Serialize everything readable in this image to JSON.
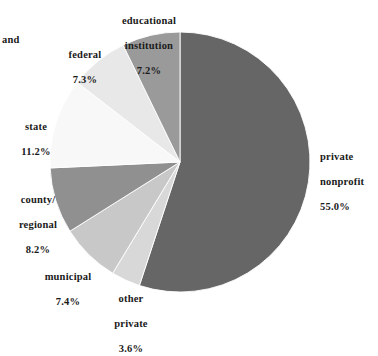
{
  "chart_data": {
    "type": "pie",
    "title": "",
    "subtitle": "",
    "xlabel": "",
    "ylabel": "",
    "legend_position": "none",
    "labels_position": "outside-callouts",
    "grid": false,
    "units": "percent",
    "total": 99.9,
    "start_angle_deg": 0,
    "direction": "clockwise",
    "categories": [
      "private nonprofit",
      "other private",
      "municipal",
      "county/ regional",
      "state",
      "federal",
      "educational institution"
    ],
    "values": [
      55.0,
      3.6,
      7.4,
      8.2,
      11.2,
      7.3,
      7.2
    ],
    "colors": [
      "#666666",
      "#d8d8d8",
      "#c8c8c8",
      "#909090",
      "#f8f8f8",
      "#e8e8e8",
      "#9a9a9a"
    ],
    "slices": [
      {
        "name": "private nonprofit",
        "label_line1": "private",
        "label_line2": "nonprofit",
        "value": 55.0,
        "value_text": "55.0%",
        "color": "#666666"
      },
      {
        "name": "other private",
        "label_line1": "other",
        "label_line2": "private",
        "value": 3.6,
        "value_text": "3.6%",
        "color": "#d8d8d8"
      },
      {
        "name": "municipal",
        "label_line1": "municipal",
        "label_line2": "",
        "value": 7.4,
        "value_text": "7.4%",
        "color": "#c8c8c8"
      },
      {
        "name": "county/regional",
        "label_line1": "county/",
        "label_line2": "regional",
        "value": 8.2,
        "value_text": "8.2%",
        "color": "#909090"
      },
      {
        "name": "state",
        "label_line1": "state",
        "label_line2": "",
        "value": 11.2,
        "value_text": "11.2%",
        "color": "#f8f8f8"
      },
      {
        "name": "federal",
        "label_line1": "federal",
        "label_line2": "",
        "value": 7.3,
        "value_text": "7.3%",
        "color": "#e8e8e8"
      },
      {
        "name": "educational institution",
        "label_line1": "educational",
        "label_line2": "institution",
        "value": 7.2,
        "value_text": "7.2%",
        "color": "#9a9a9a"
      }
    ]
  },
  "callouts": {
    "stray_text": "and",
    "educational": {
      "line1": "educational",
      "line2": "institution",
      "pct": "7.2%"
    },
    "federal": {
      "line1": "federal",
      "line2": "",
      "pct": "7.3%"
    },
    "state": {
      "line1": "state",
      "line2": "",
      "pct": "11.2%"
    },
    "county": {
      "line1": "county/",
      "line2": "regional",
      "pct": "8.2%"
    },
    "municipal": {
      "line1": "municipal",
      "line2": "",
      "pct": "7.4%"
    },
    "other": {
      "line1": "other",
      "line2": "private",
      "pct": "3.6%"
    },
    "private": {
      "line1": "private",
      "line2": "nonprofit",
      "pct": "55.0%"
    }
  }
}
